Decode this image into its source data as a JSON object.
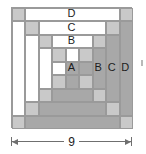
{
  "figure": {
    "kind": "quilt-block-diagram",
    "name": "Courthouse Steps log cabin block",
    "grid_units": 9
  },
  "colors": {
    "light": "#ffffff",
    "medium": "#c9c9c9",
    "dark": "#a8a8a8",
    "outline": "#9a9a9a",
    "text": "#1c1c1c",
    "dimension": "#6f6f6f"
  },
  "labels": {
    "a": "A",
    "b_center": "B",
    "b_right": "B",
    "c_center": "C",
    "c_right": "C",
    "d_center": "D",
    "d_right": "D"
  },
  "dimension": {
    "value": "9",
    "arrow_left": "arrow-left",
    "arrow_right": "arrow-right"
  },
  "chart_data": {
    "type": "table",
    "unit_px": 13.444,
    "cells": [
      {
        "name": "d-top-left-corner",
        "x": 0,
        "y": 0,
        "w": 1,
        "h": 1,
        "fill": "#c9c9c9"
      },
      {
        "name": "d-top-strip",
        "x": 1,
        "y": 0,
        "w": 7,
        "h": 1,
        "fill": "#ffffff"
      },
      {
        "name": "d-top-right-corner",
        "x": 8,
        "y": 0,
        "w": 1,
        "h": 1,
        "fill": "#c9c9c9"
      },
      {
        "name": "d-left-strip",
        "x": 0,
        "y": 1,
        "w": 1,
        "h": 7,
        "fill": "#ffffff"
      },
      {
        "name": "d-right-strip",
        "x": 8,
        "y": 1,
        "w": 1,
        "h": 7,
        "fill": "#a8a8a8"
      },
      {
        "name": "d-bottom-left-corner",
        "x": 0,
        "y": 8,
        "w": 1,
        "h": 1,
        "fill": "#c9c9c9"
      },
      {
        "name": "d-bottom-strip",
        "x": 1,
        "y": 8,
        "w": 7,
        "h": 1,
        "fill": "#a8a8a8"
      },
      {
        "name": "d-bottom-right-corner",
        "x": 8,
        "y": 8,
        "w": 1,
        "h": 1,
        "fill": "#c9c9c9"
      },
      {
        "name": "c-top-left-corner",
        "x": 1,
        "y": 1,
        "w": 1,
        "h": 1,
        "fill": "#c9c9c9"
      },
      {
        "name": "c-top-strip",
        "x": 2,
        "y": 1,
        "w": 5,
        "h": 1,
        "fill": "#ffffff"
      },
      {
        "name": "c-top-right-corner",
        "x": 7,
        "y": 1,
        "w": 1,
        "h": 1,
        "fill": "#c9c9c9"
      },
      {
        "name": "c-left-strip",
        "x": 1,
        "y": 2,
        "w": 1,
        "h": 5,
        "fill": "#ffffff"
      },
      {
        "name": "c-right-strip",
        "x": 7,
        "y": 2,
        "w": 1,
        "h": 5,
        "fill": "#a8a8a8"
      },
      {
        "name": "c-bottom-left-corner",
        "x": 1,
        "y": 7,
        "w": 1,
        "h": 1,
        "fill": "#c9c9c9"
      },
      {
        "name": "c-bottom-strip",
        "x": 2,
        "y": 7,
        "w": 5,
        "h": 1,
        "fill": "#a8a8a8"
      },
      {
        "name": "c-bottom-right-corner",
        "x": 7,
        "y": 7,
        "w": 1,
        "h": 1,
        "fill": "#c9c9c9"
      },
      {
        "name": "b-top-left-corner",
        "x": 2,
        "y": 2,
        "w": 1,
        "h": 1,
        "fill": "#c9c9c9"
      },
      {
        "name": "b-top-strip",
        "x": 3,
        "y": 2,
        "w": 3,
        "h": 1,
        "fill": "#ffffff"
      },
      {
        "name": "b-top-right-corner",
        "x": 6,
        "y": 2,
        "w": 1,
        "h": 1,
        "fill": "#c9c9c9"
      },
      {
        "name": "b-left-strip",
        "x": 2,
        "y": 3,
        "w": 1,
        "h": 3,
        "fill": "#ffffff"
      },
      {
        "name": "b-right-strip",
        "x": 6,
        "y": 3,
        "w": 1,
        "h": 3,
        "fill": "#a8a8a8"
      },
      {
        "name": "b-bottom-left-corner",
        "x": 2,
        "y": 6,
        "w": 1,
        "h": 1,
        "fill": "#c9c9c9"
      },
      {
        "name": "b-bottom-strip",
        "x": 3,
        "y": 6,
        "w": 3,
        "h": 1,
        "fill": "#a8a8a8"
      },
      {
        "name": "b-bottom-right-corner",
        "x": 6,
        "y": 6,
        "w": 1,
        "h": 1,
        "fill": "#c9c9c9"
      },
      {
        "name": "a-nw",
        "x": 3,
        "y": 3,
        "w": 1,
        "h": 1,
        "fill": "#c9c9c9"
      },
      {
        "name": "a-n",
        "x": 4,
        "y": 3,
        "w": 1,
        "h": 1,
        "fill": "#ffffff"
      },
      {
        "name": "a-ne",
        "x": 5,
        "y": 3,
        "w": 1,
        "h": 1,
        "fill": "#c9c9c9"
      },
      {
        "name": "a-w",
        "x": 3,
        "y": 4,
        "w": 1,
        "h": 1,
        "fill": "#ffffff"
      },
      {
        "name": "a-center",
        "x": 4,
        "y": 4,
        "w": 1,
        "h": 1,
        "fill": "#a8a8a8"
      },
      {
        "name": "a-e",
        "x": 5,
        "y": 4,
        "w": 1,
        "h": 1,
        "fill": "#a8a8a8"
      },
      {
        "name": "a-sw",
        "x": 3,
        "y": 5,
        "w": 1,
        "h": 1,
        "fill": "#c9c9c9"
      },
      {
        "name": "a-s",
        "x": 4,
        "y": 5,
        "w": 1,
        "h": 1,
        "fill": "#a8a8a8"
      },
      {
        "name": "a-se",
        "x": 5,
        "y": 5,
        "w": 1,
        "h": 1,
        "fill": "#c9c9c9"
      }
    ],
    "annotations": [
      {
        "text": "A",
        "x": 4.5,
        "y": 4.5
      },
      {
        "text": "B",
        "x": 4.5,
        "y": 2.5
      },
      {
        "text": "C",
        "x": 4.5,
        "y": 1.5
      },
      {
        "text": "D",
        "x": 4.5,
        "y": 0.5
      },
      {
        "text": "B",
        "x": 6.5,
        "y": 4.5
      },
      {
        "text": "C",
        "x": 7.5,
        "y": 4.5
      },
      {
        "text": "D",
        "x": 8.5,
        "y": 4.5
      }
    ]
  }
}
